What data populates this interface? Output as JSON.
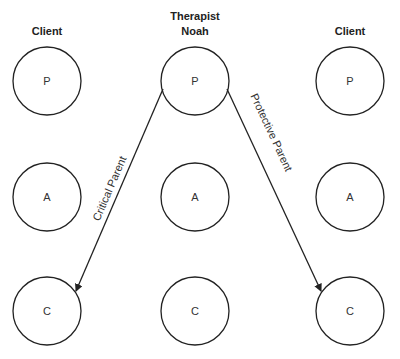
{
  "columns": [
    {
      "header": [
        "Client"
      ],
      "x": 47
    },
    {
      "header": [
        "Therapist",
        "Noah"
      ],
      "x": 195
    },
    {
      "header": [
        "Client"
      ],
      "x": 350
    }
  ],
  "nodes": {
    "left": {
      "P": "P",
      "A": "A",
      "C": "C"
    },
    "center": {
      "P": "P",
      "A": "A",
      "C": "C"
    },
    "right": {
      "P": "P",
      "A": "A",
      "C": "C"
    }
  },
  "edges": [
    {
      "from": "center.P",
      "to": "left.C",
      "label": "Critical Parent"
    },
    {
      "from": "center.P",
      "to": "right.C",
      "label": "Protective Parent"
    }
  ],
  "colors": {
    "stroke": "#222222",
    "background": "#ffffff"
  }
}
